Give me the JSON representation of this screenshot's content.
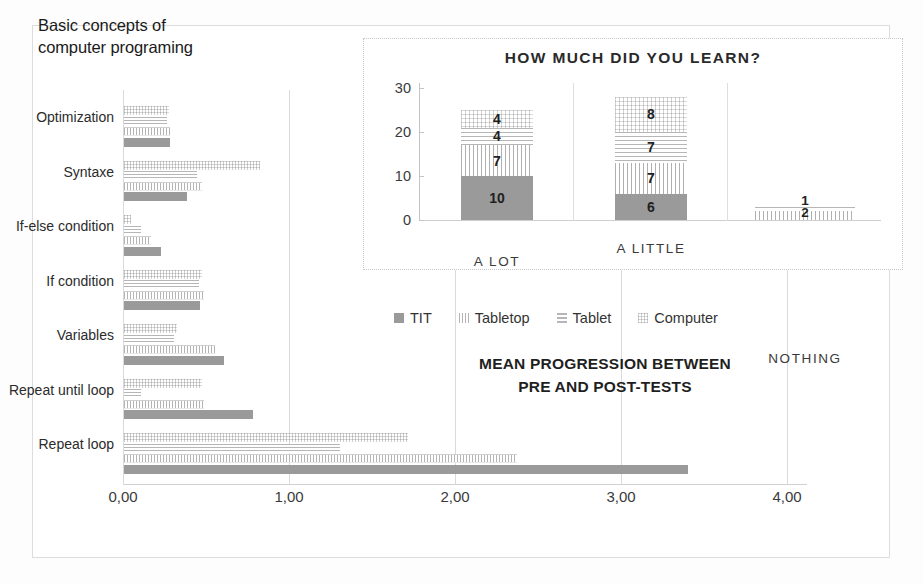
{
  "main_title": "Basic concepts of\ncomputer programing",
  "caption": "MEAN PROGRESSION BETWEEN\nPRE AND POST-TESTS",
  "caption_line1": "MEAN PROGRESSION BETWEEN",
  "caption_line2": "PRE AND POST-TESTS",
  "legend": {
    "items": [
      {
        "label": "TIT",
        "icon": "solid-gray-swatch",
        "color": "#9a9a9a"
      },
      {
        "label": "Tabletop",
        "icon": "vertical-hatch-swatch",
        "color": "#b4b4b4"
      },
      {
        "label": "Tablet",
        "icon": "horizontal-line-swatch",
        "color": "#b6b6b6"
      },
      {
        "label": "Computer",
        "icon": "dotted-swatch",
        "color": "#d2d2d2"
      }
    ]
  },
  "chart_data": [
    {
      "type": "bar",
      "orientation": "horizontal",
      "title": "Basic concepts of computer programing",
      "subtitle": "MEAN PROGRESSION BETWEEN PRE AND POST-TESTS",
      "xlabel": "",
      "ylabel": "",
      "xlim": [
        0,
        4
      ],
      "xticks": [
        0,
        1,
        2,
        3,
        4
      ],
      "xtick_labels": [
        "0,00",
        "1,00",
        "2,00",
        "3,00",
        "4,00"
      ],
      "grid": "vertical",
      "legend_position": "center",
      "categories": [
        "Optimization",
        "Syntaxe",
        "If-else condition",
        "If condition",
        "Variables",
        "Repeat until loop",
        "Repeat loop"
      ],
      "series": [
        {
          "name": "Computer",
          "values": [
            0.27,
            0.82,
            0.04,
            0.47,
            0.32,
            0.47,
            1.71
          ]
        },
        {
          "name": "Tablet",
          "values": [
            0.26,
            0.44,
            0.1,
            0.45,
            0.3,
            0.1,
            1.3
          ]
        },
        {
          "name": "Tabletop",
          "values": [
            0.28,
            0.47,
            0.16,
            0.48,
            0.55,
            0.48,
            2.37
          ]
        },
        {
          "name": "TIT",
          "values": [
            0.28,
            0.38,
            0.22,
            0.46,
            0.6,
            0.78,
            3.4
          ]
        }
      ]
    },
    {
      "type": "bar",
      "subtype": "stacked",
      "orientation": "vertical",
      "title": "HOW MUCH DID YOU LEARN?",
      "xlabel": "",
      "ylabel": "",
      "ylim": [
        0,
        30
      ],
      "yticks": [
        0,
        10,
        20,
        30
      ],
      "ytick_labels": [
        "0",
        "10",
        "20",
        "30"
      ],
      "grid": "none",
      "categories": [
        "A LOT",
        "A LITTLE",
        "NOTHING"
      ],
      "series": [
        {
          "name": "TIT",
          "values": [
            10,
            6,
            0
          ]
        },
        {
          "name": "Tabletop",
          "values": [
            7,
            7,
            2
          ]
        },
        {
          "name": "Tablet",
          "values": [
            4,
            7,
            1
          ]
        },
        {
          "name": "Computer",
          "values": [
            4,
            8,
            0
          ]
        }
      ]
    }
  ]
}
